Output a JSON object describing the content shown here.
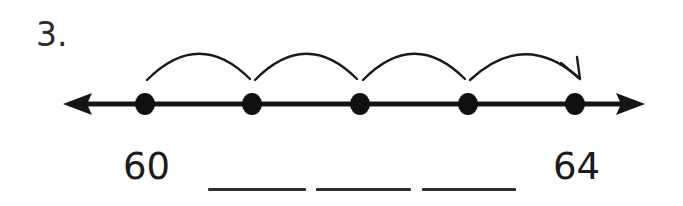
{
  "problem": {
    "number_label": "3.",
    "type": "number-line-skip-counting"
  },
  "number_line": {
    "axis": {
      "y": 104,
      "x_start": 63,
      "x_end": 645,
      "stroke_width": 5,
      "color": "#141414",
      "left_arrow": "arrow-left",
      "right_arrow": "arrow-right"
    },
    "points": [
      {
        "index": 0,
        "x": 145,
        "label": "60",
        "label_shown": true
      },
      {
        "index": 1,
        "x": 252,
        "label": "",
        "label_shown": false
      },
      {
        "index": 2,
        "x": 360,
        "label": "",
        "label_shown": false
      },
      {
        "index": 3,
        "x": 468,
        "label": "",
        "label_shown": false
      },
      {
        "index": 4,
        "x": 575,
        "label": "64",
        "label_shown": true
      }
    ],
    "point_radius": 9,
    "point_color": "#101010",
    "jumps": [
      {
        "index": 0,
        "from_x": 145,
        "to_x": 252,
        "peak_y": 47,
        "has_arrowhead": false
      },
      {
        "index": 1,
        "from_x": 252,
        "to_x": 360,
        "peak_y": 47,
        "has_arrowhead": false
      },
      {
        "index": 2,
        "from_x": 360,
        "to_x": 468,
        "peak_y": 47,
        "has_arrowhead": false
      },
      {
        "index": 3,
        "from_x": 468,
        "to_x": 575,
        "peak_y": 47,
        "has_arrowhead": true
      }
    ],
    "jump_stroke_width": 2,
    "jump_color": "#1a1a1a"
  },
  "answers": {
    "start_value": "60",
    "end_value": "64",
    "blanks": [
      {
        "index": 0,
        "value": ""
      },
      {
        "index": 1,
        "value": ""
      },
      {
        "index": 2,
        "value": ""
      }
    ]
  },
  "colors": {
    "background": "#ffffff",
    "ink": "#1a1a1a",
    "ink_soft": "#2e2e2e"
  }
}
